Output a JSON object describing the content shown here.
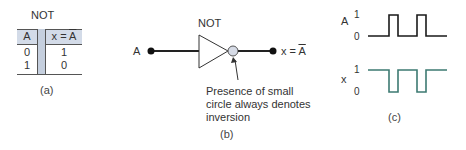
{
  "panel_a": {
    "title": "NOT",
    "headers": [
      "A",
      "x = A̅"
    ],
    "header_input": "A",
    "header_output_prefix": "x = ",
    "header_output_var": "A",
    "rows": [
      {
        "A": "0",
        "x": "1"
      },
      {
        "A": "1",
        "x": "0"
      }
    ],
    "caption": "(a)",
    "colors": {
      "header_fill": "#d3dbe8",
      "separator_fill": "#c5cfde",
      "rule": "#555555"
    }
  },
  "panel_b": {
    "gate_label": "NOT",
    "input_label": "A",
    "output_prefix": "x = ",
    "output_var": "A",
    "annotation_lines": [
      "Presence of small",
      "circle always denotes",
      "inversion"
    ],
    "caption": "(b)",
    "colors": {
      "bubble_fill": "#d6dbe6",
      "wire": "#222222"
    }
  },
  "panel_c": {
    "signal_a_label": "A",
    "signal_x_label": "x",
    "level_high": "1",
    "level_low": "0",
    "caption": "(c)",
    "colors": {
      "signal_a": "#1a1a1a",
      "signal_x": "#3d7a72"
    },
    "waveforms": {
      "A": [
        0,
        1,
        0,
        1,
        0
      ],
      "x": [
        1,
        0,
        1,
        0,
        1
      ]
    }
  }
}
